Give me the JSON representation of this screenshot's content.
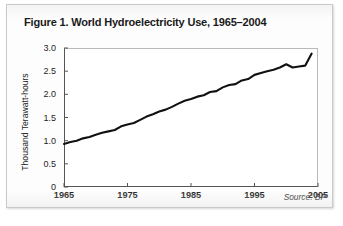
{
  "figure": {
    "title": "Figure 1. World Hydroelectricity Use, 1965–2004",
    "source_note": "Source: BP"
  },
  "chart_data": {
    "type": "line",
    "title": "Figure 1. World Hydroelectricity Use, 1965–2004",
    "subtitle": "",
    "xlabel": "",
    "ylabel": "Thousand Terawatt-hours",
    "annotation": "Source: BP",
    "grid": false,
    "legend": "none",
    "xlim": [
      1965,
      2005
    ],
    "ylim": [
      0,
      3.0
    ],
    "xticks": [
      1965,
      1975,
      1985,
      1995,
      2005
    ],
    "xticklabels": [
      "1965",
      "1975",
      "1985",
      "1995",
      "2005"
    ],
    "yticks": [
      0,
      0.5,
      1.0,
      1.5,
      2.0,
      2.5,
      3.0
    ],
    "yticklabels": [
      "0",
      "0.5",
      "1.0",
      "1.5",
      "2.0",
      "2.5",
      "3.0"
    ],
    "series": [
      {
        "name": "World hydroelectricity use",
        "color": "#111111",
        "x": [
          1965,
          1966,
          1967,
          1968,
          1969,
          1970,
          1971,
          1972,
          1973,
          1974,
          1975,
          1976,
          1977,
          1978,
          1979,
          1980,
          1981,
          1982,
          1983,
          1984,
          1985,
          1986,
          1987,
          1988,
          1989,
          1990,
          1991,
          1992,
          1993,
          1994,
          1995,
          1996,
          1997,
          1998,
          1999,
          2000,
          2001,
          2002,
          2003,
          2004
        ],
        "values": [
          0.93,
          0.97,
          1.0,
          1.05,
          1.08,
          1.13,
          1.17,
          1.2,
          1.23,
          1.31,
          1.35,
          1.38,
          1.45,
          1.52,
          1.57,
          1.63,
          1.67,
          1.73,
          1.8,
          1.86,
          1.9,
          1.95,
          1.98,
          2.05,
          2.07,
          2.15,
          2.2,
          2.22,
          2.3,
          2.33,
          2.42,
          2.46,
          2.5,
          2.53,
          2.58,
          2.65,
          2.58,
          2.6,
          2.62,
          2.88
        ]
      }
    ]
  }
}
